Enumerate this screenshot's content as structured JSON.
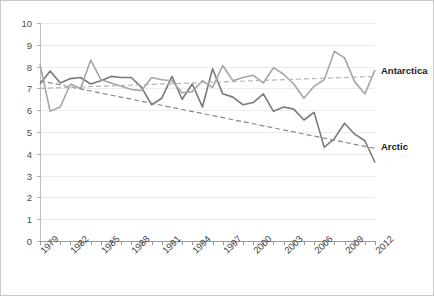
{
  "chart_data": {
    "type": "line",
    "title": "",
    "subtitle": "",
    "xlabel": "",
    "ylabel": "",
    "xlim": [
      1979,
      2012
    ],
    "ylim": [
      0,
      10
    ],
    "y_ticks": [
      0,
      1,
      2,
      3,
      4,
      5,
      6,
      7,
      8,
      9,
      10
    ],
    "x": [
      1979,
      1980,
      1981,
      1982,
      1983,
      1984,
      1985,
      1986,
      1987,
      1988,
      1989,
      1990,
      1991,
      1992,
      1993,
      1994,
      1995,
      1996,
      1997,
      1998,
      1999,
      2000,
      2001,
      2002,
      2003,
      2004,
      2005,
      2006,
      2007,
      2008,
      2009,
      2010,
      2011,
      2012
    ],
    "x_tick_labels": [
      "1979",
      "1982",
      "1985",
      "1988",
      "1991",
      "1994",
      "1997",
      "2000",
      "2003",
      "2006",
      "2009",
      "2012"
    ],
    "x_tick_label_years": [
      1979,
      1982,
      1985,
      1988,
      1991,
      1994,
      1997,
      2000,
      2003,
      2006,
      2009,
      2012
    ],
    "grid": true,
    "legend_position": "inline-right",
    "series": [
      {
        "name": "Arctic",
        "color": "#7a7a7a",
        "style": "solid",
        "values": [
          7.2,
          7.8,
          7.25,
          7.45,
          7.5,
          7.2,
          7.35,
          7.55,
          7.5,
          7.5,
          7.05,
          6.25,
          6.55,
          7.55,
          6.5,
          7.2,
          6.15,
          7.9,
          6.75,
          6.6,
          6.25,
          6.35,
          6.75,
          5.95,
          6.15,
          6.05,
          5.55,
          5.9,
          4.3,
          4.7,
          5.4,
          4.9,
          4.6,
          3.6
        ]
      },
      {
        "name": "Antarctica",
        "color": "#a6a6a6",
        "style": "solid",
        "values": [
          8.1,
          5.95,
          6.15,
          7.2,
          7.0,
          8.3,
          7.4,
          7.25,
          7.1,
          6.95,
          6.9,
          7.5,
          7.4,
          7.35,
          6.8,
          6.85,
          7.35,
          7.05,
          8.05,
          7.35,
          7.5,
          7.6,
          7.25,
          7.95,
          7.65,
          7.2,
          6.55,
          7.1,
          7.4,
          8.7,
          8.4,
          7.3,
          6.75,
          7.85
        ]
      }
    ],
    "trendlines": [
      {
        "name": "Arctic trend",
        "style": "dashed",
        "color": "#8a8a8a",
        "start": [
          1979,
          7.35
        ],
        "end": [
          2012,
          4.25
        ]
      },
      {
        "name": "Antarctica trend",
        "style": "dashed",
        "color": "#b5b5b5",
        "start": [
          1979,
          7.0
        ],
        "end": [
          2012,
          7.55
        ]
      }
    ],
    "annotations": [
      {
        "text": "Antarctica",
        "year": 2012,
        "value": 7.8
      },
      {
        "text": "Arctic",
        "year": 2012,
        "value": 4.3
      }
    ]
  }
}
